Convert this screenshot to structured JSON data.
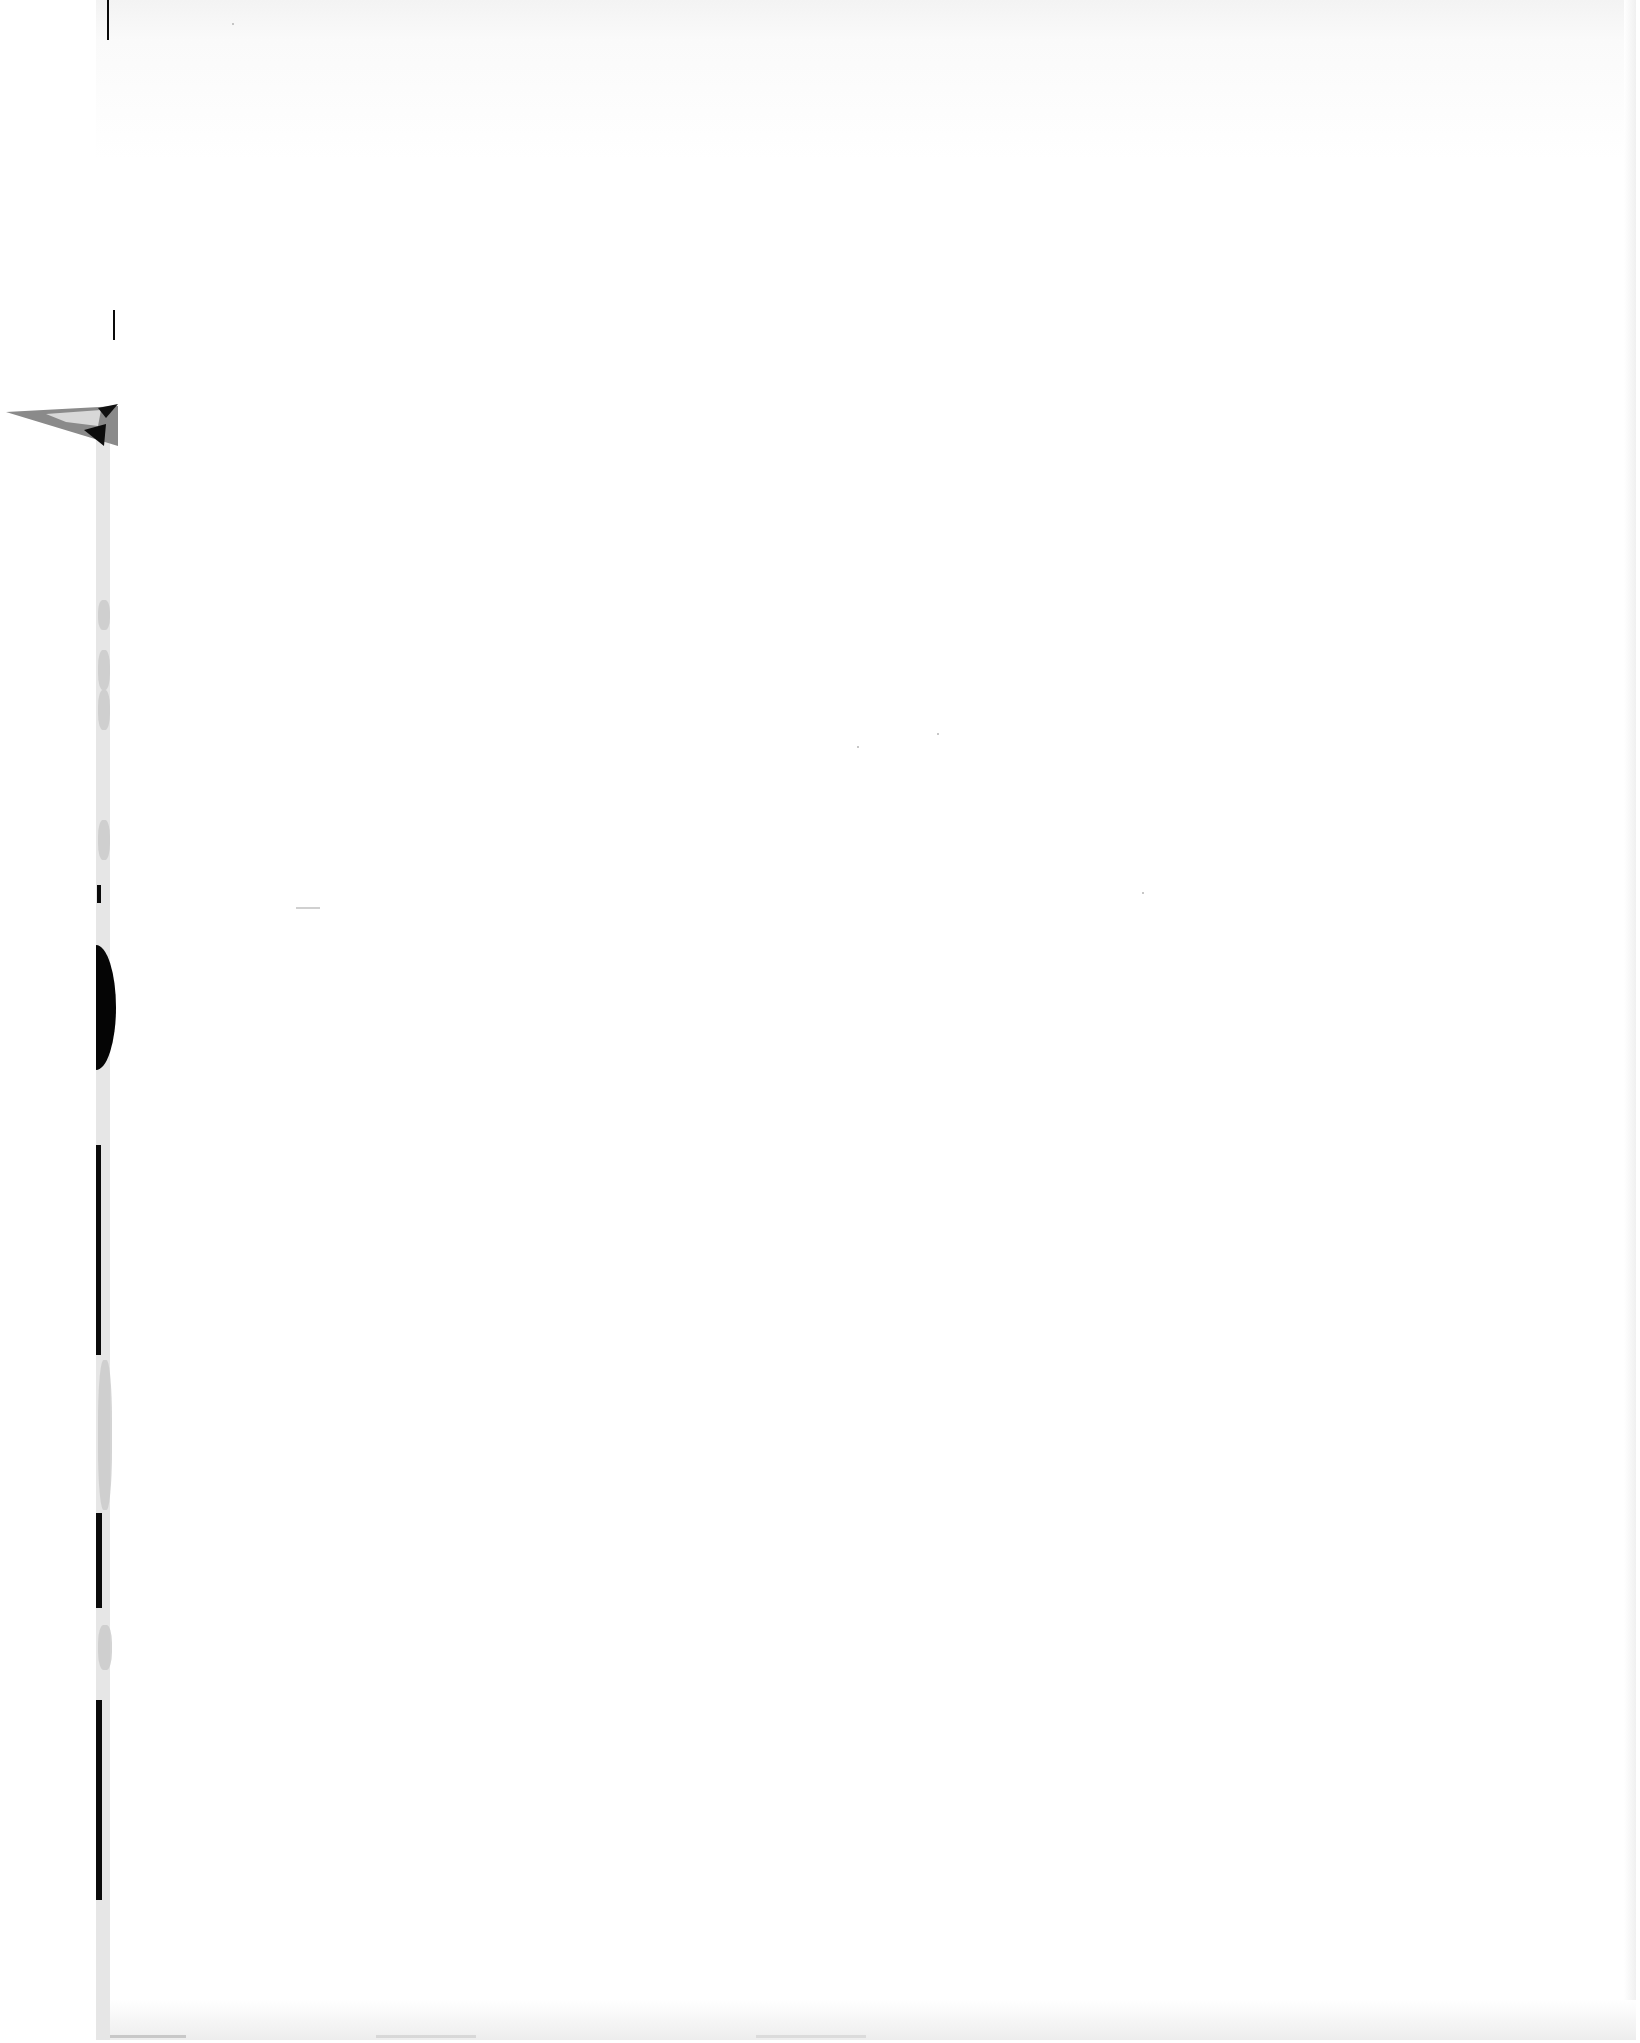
{
  "document": {
    "page_type": "blank scanned page",
    "text_content": "",
    "colors": {
      "paper": "#ffffff",
      "edge_shadow": "#f0f0f0",
      "binding_dark": "#0a0a0a",
      "binding_grey": "#c9c9c9"
    }
  }
}
